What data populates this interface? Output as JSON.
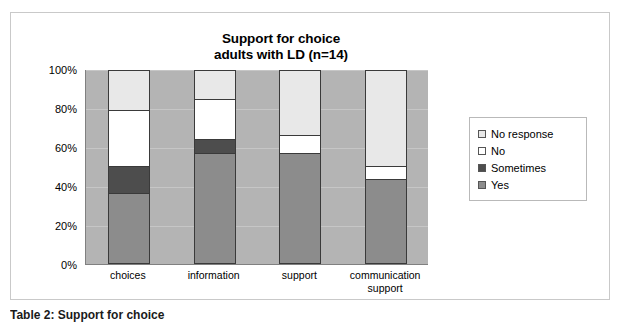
{
  "chart_data": {
    "type": "bar",
    "subtype": "100% stacked column",
    "title": "Support for choice adults with LD (n=14)",
    "title_lines": [
      "Support for choice",
      "adults with LD (n=14)"
    ],
    "xlabel": "",
    "ylabel": "",
    "categories": [
      "choices",
      "information",
      "support",
      "communication support"
    ],
    "category_lines": [
      [
        "choices"
      ],
      [
        "information"
      ],
      [
        "support"
      ],
      [
        "communication",
        "support"
      ]
    ],
    "series": [
      {
        "name": "Yes",
        "values": [
          36,
          57,
          57,
          43
        ],
        "color": "#8c8c8c"
      },
      {
        "name": "Sometimes",
        "values": [
          14,
          7,
          0,
          0
        ],
        "color": "#4d4d4d"
      },
      {
        "name": "No",
        "values": [
          29,
          21,
          9,
          7
        ],
        "color": "#ffffff"
      },
      {
        "name": "No response",
        "values": [
          21,
          15,
          34,
          50
        ],
        "color": "#e8e8e8"
      }
    ],
    "stack_order_bottom_to_top": [
      "Yes",
      "Sometimes",
      "No",
      "No response"
    ],
    "ylim": [
      0,
      100
    ],
    "yticks": [
      0,
      20,
      40,
      60,
      80,
      100
    ],
    "ytick_labels": [
      "0%",
      "20%",
      "40%",
      "60%",
      "80%",
      "100%"
    ],
    "grid": true,
    "grid_axis": "y",
    "legend_position": "right",
    "legend_entries": [
      {
        "label": "No response",
        "color": "#e8e8e8"
      },
      {
        "label": "No",
        "color": "#ffffff"
      },
      {
        "label": "Sometimes",
        "color": "#4d4d4d"
      },
      {
        "label": "Yes",
        "color": "#8c8c8c"
      }
    ],
    "plot_background": "#b4b4b4",
    "figure_background": "#ffffff"
  },
  "caption": {
    "text": "Table 2: Support for choice"
  }
}
